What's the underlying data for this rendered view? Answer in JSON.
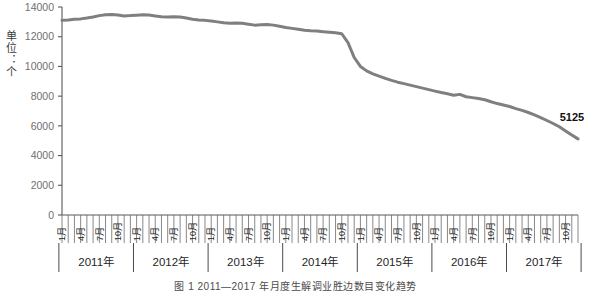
{
  "figure": {
    "caption": "图 1   2011—2017 年月度生解调业胜边数目变化趋势",
    "unit_label": "单位：个",
    "line_color": "#7f7f7f",
    "axis_color": "#595959",
    "tick_text_color": "#6f6f6f"
  },
  "chart_data": {
    "type": "line",
    "title": "",
    "xlabel": "",
    "ylabel": "单位：个",
    "ylim": [
      0,
      14000
    ],
    "yticks": [
      0,
      2000,
      4000,
      6000,
      8000,
      10000,
      12000,
      14000
    ],
    "ytick_labels": [
      "0",
      "2000",
      "4000",
      "6000",
      "8000",
      "10000",
      "12000",
      "14000"
    ],
    "grid": false,
    "legend": "none",
    "year_groups": [
      "2011年",
      "2012年",
      "2013年",
      "2014年",
      "2015年",
      "2016年",
      "2017年"
    ],
    "month_tick_labels": [
      "1月",
      "4月",
      "7月",
      "10月"
    ],
    "month_tick_label_interval": 3,
    "annotations": [
      {
        "text": "5125",
        "x": "2017年12月",
        "value": 5125
      }
    ],
    "x": [
      "2011-01",
      "2011-02",
      "2011-03",
      "2011-04",
      "2011-05",
      "2011-06",
      "2011-07",
      "2011-08",
      "2011-09",
      "2011-10",
      "2011-11",
      "2011-12",
      "2012-01",
      "2012-02",
      "2012-03",
      "2012-04",
      "2012-05",
      "2012-06",
      "2012-07",
      "2012-08",
      "2012-09",
      "2012-10",
      "2012-11",
      "2012-12",
      "2013-01",
      "2013-02",
      "2013-03",
      "2013-04",
      "2013-05",
      "2013-06",
      "2013-07",
      "2013-08",
      "2013-09",
      "2013-10",
      "2013-11",
      "2013-12",
      "2014-01",
      "2014-02",
      "2014-03",
      "2014-04",
      "2014-05",
      "2014-06",
      "2014-07",
      "2014-08",
      "2014-09",
      "2014-10",
      "2014-11",
      "2014-12",
      "2015-01",
      "2015-02",
      "2015-03",
      "2015-04",
      "2015-05",
      "2015-06",
      "2015-07",
      "2015-08",
      "2015-09",
      "2015-10",
      "2015-11",
      "2015-12",
      "2016-01",
      "2016-02",
      "2016-03",
      "2016-04",
      "2016-05",
      "2016-06",
      "2016-07",
      "2016-08",
      "2016-09",
      "2016-10",
      "2016-11",
      "2016-12",
      "2017-01",
      "2017-02",
      "2017-03",
      "2017-04",
      "2017-05",
      "2017-06",
      "2017-07",
      "2017-08",
      "2017-09",
      "2017-10",
      "2017-11",
      "2017-12"
    ],
    "values": [
      13100,
      13120,
      13180,
      13200,
      13260,
      13330,
      13420,
      13480,
      13500,
      13460,
      13400,
      13420,
      13450,
      13480,
      13460,
      13400,
      13340,
      13330,
      13350,
      13320,
      13260,
      13180,
      13120,
      13100,
      13060,
      13000,
      12940,
      12900,
      12920,
      12900,
      12840,
      12780,
      12800,
      12820,
      12780,
      12700,
      12620,
      12560,
      12500,
      12440,
      12400,
      12380,
      12340,
      12300,
      12260,
      12200,
      11600,
      10600,
      10000,
      9700,
      9500,
      9350,
      9200,
      9060,
      8940,
      8840,
      8740,
      8640,
      8540,
      8440,
      8340,
      8240,
      8160,
      8060,
      8120,
      7960,
      7900,
      7840,
      7760,
      7620,
      7500,
      7400,
      7300,
      7160,
      7040,
      6900,
      6740,
      6560,
      6360,
      6160,
      5940,
      5660,
      5380,
      5125
    ]
  }
}
